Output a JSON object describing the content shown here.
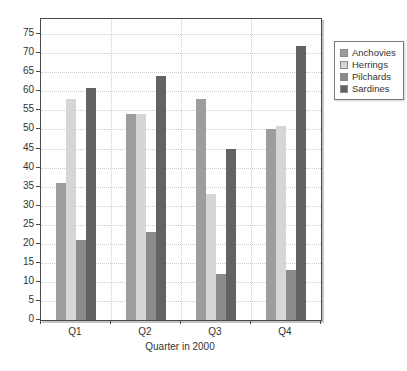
{
  "chart_data": {
    "type": "bar",
    "title": "",
    "categories": [
      "Q1",
      "Q2",
      "Q3",
      "Q4"
    ],
    "series": [
      {
        "name": "Anchovies",
        "color": "#9d9d9d",
        "values": [
          36,
          54,
          58,
          50
        ]
      },
      {
        "name": "Herrings",
        "color": "#d6d6d6",
        "values": [
          58,
          54,
          33,
          51
        ]
      },
      {
        "name": "Pilchards",
        "color": "#8b8b8b",
        "values": [
          21,
          23,
          12,
          13
        ]
      },
      {
        "name": "Sardines",
        "color": "#636363",
        "values": [
          61,
          64,
          45,
          72
        ]
      }
    ],
    "xlabel": "Quarter in 2000",
    "ylabel": "",
    "ylim": [
      0,
      79
    ],
    "ytick_step": 5,
    "yticks": [
      0,
      5,
      10,
      15,
      20,
      25,
      30,
      35,
      40,
      45,
      50,
      55,
      60,
      65,
      70,
      75
    ],
    "grid": true,
    "legend": {
      "position": "top-right",
      "entries": [
        "Anchovies",
        "Herrings",
        "Pilchards",
        "Sardines"
      ]
    },
    "colors": {
      "axis": "#4a4a4a",
      "grid": "#cccccc",
      "text": "#333333",
      "plot_background": "#ffffff"
    }
  }
}
